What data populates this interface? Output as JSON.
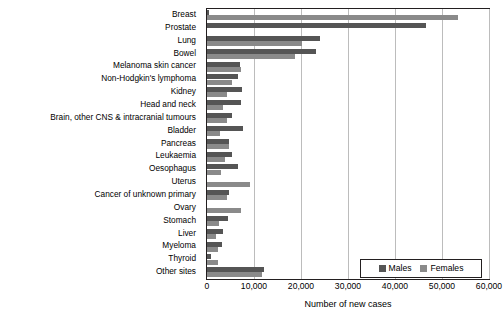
{
  "chart_data": {
    "type": "bar",
    "orientation": "horizontal",
    "title": "",
    "xlabel": "Number of new cases",
    "ylabel": "",
    "xlim": [
      0,
      60000
    ],
    "xticks": [
      "0",
      "10,000",
      "20,000",
      "30,000",
      "40,000",
      "50,000",
      "60,000"
    ],
    "xtick_values": [
      0,
      10000,
      20000,
      30000,
      40000,
      50000,
      60000
    ],
    "grid": "vertical",
    "legend_position": "bottom-right",
    "categories": [
      "Breast",
      "Prostate",
      "Lung",
      "Bowel",
      "Melanoma skin cancer",
      "Non-Hodgkin's lymphoma",
      "Kidney",
      "Head and neck",
      "Brain, other CNS & intracranial tumours",
      "Bladder",
      "Pancreas",
      "Leukaemia",
      "Oesophagus",
      "Uterus",
      "Cancer of unknown primary",
      "Ovary",
      "Stomach",
      "Liver",
      "Myeloma",
      "Thyroid",
      "Other sites"
    ],
    "series": [
      {
        "name": "Males",
        "color": "#555555",
        "values": [
          400,
          46500,
          24000,
          23200,
          7000,
          6700,
          7400,
          7300,
          5400,
          7600,
          4600,
          5300,
          6700,
          0,
          4700,
          0,
          4400,
          3500,
          3100,
          800,
          12200
        ]
      },
      {
        "name": "Females",
        "color": "#8a8a8a",
        "values": [
          53500,
          0,
          20300,
          18800,
          7300,
          5300,
          4300,
          3400,
          4300,
          2700,
          4600,
          3900,
          2900,
          9100,
          4200,
          7300,
          2600,
          1900,
          2400,
          2300,
          11600
        ]
      }
    ]
  },
  "legend": {
    "items": [
      {
        "label": "Males",
        "color": "#555555"
      },
      {
        "label": "Females",
        "color": "#8a8a8a"
      }
    ]
  },
  "axis": {
    "x_title": "Number of new cases"
  }
}
